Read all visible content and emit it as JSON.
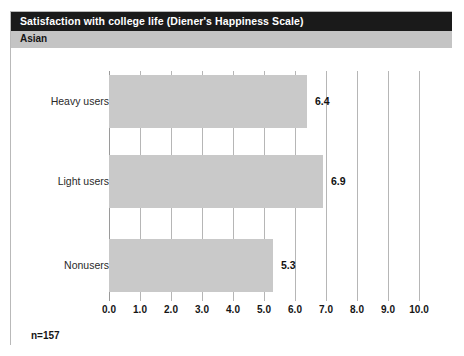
{
  "header": {
    "title": "Satisfaction with college life (Diener's Happiness Scale)",
    "group": "Asian"
  },
  "footer": {
    "sample_size": "n=157"
  },
  "colors": {
    "title_band": "#1a1a1a",
    "title_text": "#ffffff",
    "group_band": "#c4c4c4",
    "bar_fill": "#c9c9c9",
    "gridline": "#b6b6b6",
    "panel_border": "#b9b9b9"
  },
  "chart_data": {
    "type": "bar",
    "orientation": "horizontal",
    "title": "Satisfaction with college life (Diener's Happiness Scale)",
    "subtitle": "Asian",
    "categories": [
      "Heavy users",
      "Light users",
      "Nonusers"
    ],
    "values": [
      6.4,
      6.9,
      5.3
    ],
    "value_labels": [
      "6.4",
      "6.9",
      "5.3"
    ],
    "xlabel": "",
    "ylabel": "",
    "xlim": [
      0.0,
      10.0
    ],
    "xticks": [
      0.0,
      1.0,
      2.0,
      3.0,
      4.0,
      5.0,
      6.0,
      7.0,
      8.0,
      9.0,
      10.0
    ],
    "xtick_labels": [
      "0.0",
      "1.0",
      "2.0",
      "3.0",
      "4.0",
      "5.0",
      "6.0",
      "7.0",
      "8.0",
      "9.0",
      "10.0"
    ],
    "grid": true,
    "grid_axis": "x",
    "legend": false,
    "annotation": "n=157"
  }
}
